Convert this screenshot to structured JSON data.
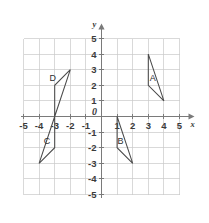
{
  "chart_data": {
    "type": "scatter",
    "title": "",
    "xlabel": "x",
    "ylabel": "y",
    "origin_label": "0",
    "xlim": [
      -5,
      5
    ],
    "ylim": [
      -5,
      5
    ],
    "grid": true,
    "legend": "none",
    "x_ticks": [
      -5,
      -4,
      -3,
      -2,
      -1,
      1,
      2,
      3,
      4,
      5
    ],
    "y_ticks": [
      -5,
      -4,
      -3,
      -2,
      -1,
      1,
      2,
      3,
      4,
      5
    ],
    "x_tick_labels": [
      "-5",
      "-4",
      "-3",
      "-2",
      "-1",
      "1",
      "2",
      "3",
      "4",
      "5"
    ],
    "y_tick_labels": [
      "-5",
      "-4",
      "-3",
      "-2",
      "-1",
      "1",
      "2",
      "3",
      "4",
      "5"
    ],
    "shapes": [
      {
        "name": "A",
        "kind": "triangle",
        "vertices": [
          [
            3,
            4
          ],
          [
            3,
            2
          ],
          [
            4,
            1
          ]
        ],
        "label_pos": [
          3.28,
          2.25
        ]
      },
      {
        "name": "B",
        "kind": "triangle",
        "vertices": [
          [
            1,
            0
          ],
          [
            1,
            -2
          ],
          [
            2,
            -3
          ]
        ],
        "label_pos": [
          1.22,
          -1.75
        ]
      },
      {
        "name": "C",
        "kind": "triangle",
        "vertices": [
          [
            -3,
            0
          ],
          [
            -3,
            -2
          ],
          [
            -4,
            -3
          ]
        ],
        "label_pos": [
          -3.5,
          -1.75
        ]
      },
      {
        "name": "D",
        "kind": "triangle",
        "vertices": [
          [
            -2,
            3
          ],
          [
            -3,
            2
          ],
          [
            -3,
            0
          ]
        ],
        "label_pos": [
          -3.12,
          2.25
        ]
      }
    ]
  },
  "figure": {
    "caption": "",
    "x_axis_name": "x",
    "y_axis_name": "y"
  }
}
